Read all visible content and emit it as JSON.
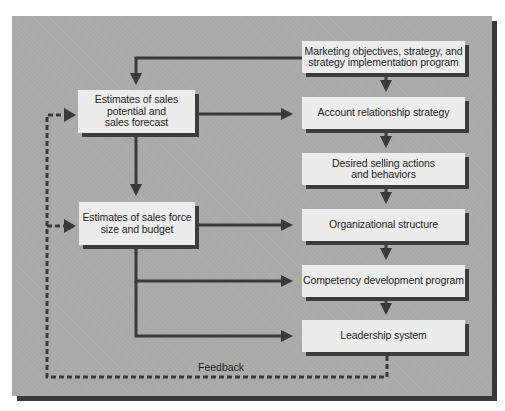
{
  "diagram": {
    "type": "flowchart",
    "colors": {
      "panel": "#a9a9a9",
      "box": "#ececec",
      "shadow": "#3c3c3c",
      "arrow": "#3a3a3a",
      "text": "#1e1e1e"
    },
    "left_column": [
      {
        "id": "sales-potential",
        "label": "Estimates of sales potential and sales forecast",
        "lines": [
          "Estimates of sales",
          "potential and",
          "sales forecast"
        ]
      },
      {
        "id": "sales-force-size",
        "label": "Estimates of sales force size and budget",
        "lines": [
          "Estimates of sales force",
          "size and budget"
        ]
      }
    ],
    "right_column": [
      {
        "id": "marketing-objectives",
        "label": "Marketing objectives, strategy, and strategy implementation program",
        "lines": [
          "Marketing objectives, strategy, and",
          "strategy implementation program"
        ]
      },
      {
        "id": "account-relationship",
        "label": "Account relationship strategy",
        "lines": [
          "Account relationship strategy"
        ]
      },
      {
        "id": "desired-selling",
        "label": "Desired selling actions and behaviors",
        "lines": [
          "Desired selling actions",
          "and behaviors"
        ]
      },
      {
        "id": "organizational-structure",
        "label": "Organizational structure",
        "lines": [
          "Organizational structure"
        ]
      },
      {
        "id": "competency-development",
        "label": "Competency development program",
        "lines": [
          "Competency development program"
        ]
      },
      {
        "id": "leadership-system",
        "label": "Leadership system",
        "lines": [
          "Leadership system"
        ]
      }
    ],
    "feedback_label": "Feedback",
    "edges": [
      {
        "from": "marketing-objectives",
        "to": "sales-potential",
        "style": "solid"
      },
      {
        "from": "marketing-objectives",
        "to": "account-relationship",
        "style": "solid"
      },
      {
        "from": "sales-potential",
        "to": "account-relationship",
        "style": "solid"
      },
      {
        "from": "account-relationship",
        "to": "desired-selling",
        "style": "solid"
      },
      {
        "from": "sales-potential",
        "to": "sales-force-size",
        "style": "solid"
      },
      {
        "from": "desired-selling",
        "to": "organizational-structure",
        "style": "solid"
      },
      {
        "from": "sales-force-size",
        "to": "organizational-structure",
        "style": "solid"
      },
      {
        "from": "organizational-structure",
        "to": "competency-development",
        "style": "solid"
      },
      {
        "from": "sales-force-size",
        "to": "competency-development",
        "style": "solid"
      },
      {
        "from": "competency-development",
        "to": "leadership-system",
        "style": "solid"
      },
      {
        "from": "sales-force-size",
        "to": "leadership-system",
        "style": "solid"
      },
      {
        "from": "leadership-system",
        "to": "sales-potential",
        "style": "dashed",
        "label": "Feedback"
      },
      {
        "from": "leadership-system",
        "to": "sales-force-size",
        "style": "dashed",
        "label": "Feedback"
      }
    ]
  }
}
